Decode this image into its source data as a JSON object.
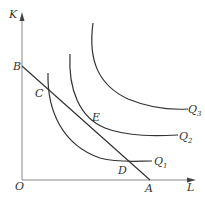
{
  "diagram": {
    "axes": {
      "y_label": "K",
      "x_label": "L",
      "origin_label": "O"
    },
    "points": {
      "B": "B",
      "A": "A",
      "C": "C",
      "E": "E",
      "D": "D"
    },
    "isoquants": [
      {
        "name": "Q",
        "sub": "1"
      },
      {
        "name": "Q",
        "sub": "2"
      },
      {
        "name": "Q",
        "sub": "3"
      }
    ],
    "colors": {
      "stroke": "#333333",
      "axis": "#777777",
      "background": "#ffffff"
    }
  }
}
